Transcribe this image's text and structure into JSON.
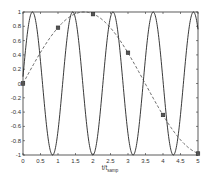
{
  "chart_data": {
    "type": "line",
    "title": "",
    "xlabel": "t/t_samp",
    "xlabel_main": "t/t",
    "xlabel_sub": "samp",
    "ylabel": "",
    "xlim": [
      0,
      5
    ],
    "ylim": [
      -1,
      1
    ],
    "grid": false,
    "legend": "none",
    "x_ticks": [
      "0",
      "0.5",
      "1",
      "1.5",
      "2",
      "2.5",
      "3",
      "3.5",
      "4",
      "4.5",
      "5"
    ],
    "y_ticks": [
      "-1",
      "-0.8",
      "-0.6",
      "-0.4",
      "-0.2",
      "0",
      "0.2",
      "0.4",
      "0.6",
      "0.8",
      "1"
    ],
    "series": [
      {
        "name": "fast sinusoid",
        "style": "solid",
        "color": "#222222",
        "function": "sin(5.4*t)",
        "peaks_x": [
          0.27,
          1.42,
          2.58,
          3.73,
          4.88
        ],
        "troughs_x": [
          0.85,
          2.0,
          3.15,
          4.3
        ]
      },
      {
        "name": "slow (aliased) sinusoid",
        "style": "dashed",
        "color": "#444444",
        "function": "sin(0.9*t)"
      },
      {
        "name": "samples",
        "style": "square-markers",
        "color": "#222222",
        "x": [
          0,
          1,
          2,
          3,
          4,
          5
        ],
        "y": [
          0.0,
          0.78,
          0.97,
          0.43,
          -0.44,
          -0.98
        ]
      }
    ]
  }
}
